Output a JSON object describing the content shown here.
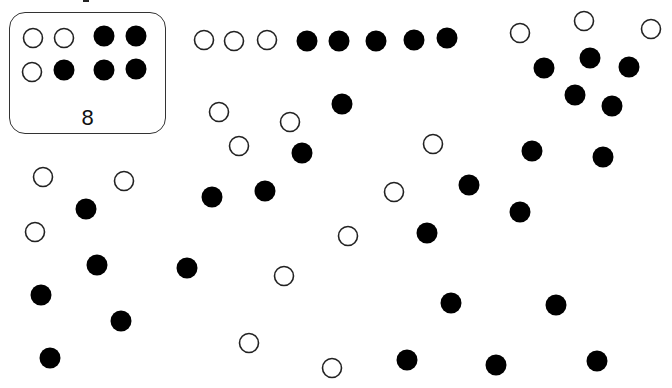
{
  "key": {
    "label": "8",
    "dots": [
      {
        "type": "hollow"
      },
      {
        "type": "hollow"
      },
      {
        "type": "filled"
      },
      {
        "type": "filled"
      },
      {
        "type": "hollow"
      },
      {
        "type": "filled"
      },
      {
        "type": "filled"
      },
      {
        "type": "filled"
      }
    ]
  },
  "colors": {
    "filled": "#000000",
    "hollow_stroke": "#222222",
    "box_border": "#333333"
  },
  "dots": [
    {
      "type": "hollow"
    },
    {
      "type": "hollow"
    },
    {
      "type": "hollow"
    },
    {
      "type": "filled"
    },
    {
      "type": "filled"
    },
    {
      "type": "filled"
    },
    {
      "type": "filled"
    },
    {
      "type": "filled"
    },
    {
      "type": "hollow"
    },
    {
      "type": "hollow"
    },
    {
      "type": "hollow"
    },
    {
      "type": "filled"
    },
    {
      "type": "filled"
    },
    {
      "type": "filled"
    },
    {
      "type": "filled"
    },
    {
      "type": "filled"
    },
    {
      "type": "hollow"
    },
    {
      "type": "hollow"
    },
    {
      "type": "hollow"
    },
    {
      "type": "filled"
    },
    {
      "type": "filled"
    },
    {
      "type": "filled"
    },
    {
      "type": "filled"
    },
    {
      "type": "hollow"
    },
    {
      "type": "hollow"
    },
    {
      "type": "filled"
    },
    {
      "type": "filled"
    },
    {
      "type": "filled"
    },
    {
      "type": "filled"
    },
    {
      "type": "filled"
    },
    {
      "type": "hollow"
    },
    {
      "type": "hollow"
    },
    {
      "type": "hollow"
    },
    {
      "type": "filled"
    },
    {
      "type": "filled"
    },
    {
      "type": "filled"
    },
    {
      "type": "filled"
    },
    {
      "type": "filled"
    },
    {
      "type": "filled"
    },
    {
      "type": "hollow"
    },
    {
      "type": "hollow"
    },
    {
      "type": "hollow"
    },
    {
      "type": "hollow"
    },
    {
      "type": "filled"
    },
    {
      "type": "filled"
    },
    {
      "type": "filled"
    },
    {
      "type": "filled"
    },
    {
      "type": "filled"
    }
  ],
  "counts": {
    "filled_total": 30,
    "hollow_total": 18
  }
}
